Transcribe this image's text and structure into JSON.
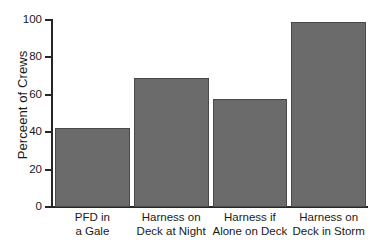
{
  "chart_data": {
    "type": "bar",
    "title": "",
    "subtitle": "",
    "xlabel": "",
    "ylabel": "Perceent of Crews",
    "categories": [
      "PFD in\na Gale",
      "Harness on\nDeck at Night",
      "Harness if\nAlone on Deck",
      "Harness on\nDeck in Storm"
    ],
    "category_lines": [
      [
        "PFD in",
        "a Gale"
      ],
      [
        "Harness on",
        "Deck at Night"
      ],
      [
        "Harness if",
        "Alone on Deck"
      ],
      [
        "Harness on",
        "Deck in Storm"
      ]
    ],
    "values": [
      42,
      69,
      58,
      99
    ],
    "ylim": [
      0,
      100
    ],
    "yticks": [
      0,
      20,
      40,
      60,
      80,
      100
    ],
    "ytick_labels": [
      "0",
      "20",
      "40",
      "60",
      "80",
      "100"
    ],
    "grid": false,
    "legend": false,
    "legend_position": "none",
    "bar_color": "#6b6b6b",
    "bar_edge_color": "#4a4a4a",
    "axis_color": "#262626",
    "background_color": "#ffffff"
  }
}
